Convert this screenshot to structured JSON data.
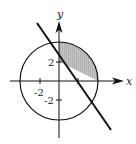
{
  "diagram": {
    "type": "coordinate-plane-region",
    "axes": {
      "x_label": "x",
      "y_label": "y"
    },
    "tick_labels": {
      "y_pos": "2",
      "y_neg": "-2",
      "x_neg": "-2"
    },
    "circle": {
      "center": [
        0,
        0
      ],
      "radius": 4
    },
    "line": {
      "equation": "x + y = 2"
    },
    "shaded_region": "inside circle, x >= 0, above line x + y = 2",
    "colors": {
      "stroke": "#111111",
      "shade": "#bdbdbd",
      "background": "#ffffff"
    }
  }
}
